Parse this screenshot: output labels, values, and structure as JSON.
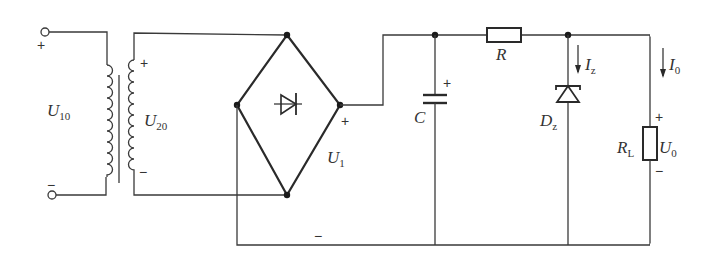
{
  "diagram": {
    "type": "circuit-schematic",
    "colors": {
      "line": "#3a3a3a",
      "background": "#ffffff"
    },
    "labels": {
      "primary_voltage": {
        "main": "U",
        "sub": "10"
      },
      "secondary_voltage": {
        "main": "U",
        "sub": "20"
      },
      "rectified_voltage": {
        "main": "U",
        "sub": "1"
      },
      "capacitor": {
        "main": "C"
      },
      "resistor": {
        "main": "R"
      },
      "zener": {
        "main": "D",
        "sub": "z"
      },
      "zener_current": {
        "main": "I",
        "sub": "z"
      },
      "load_current": {
        "main": "I",
        "sub": "0"
      },
      "load_resistor": {
        "main": "R",
        "sub": "L"
      },
      "output_voltage": {
        "main": "U",
        "sub": "0"
      }
    },
    "signs": {
      "primary_plus": "+",
      "primary_minus": "−",
      "secondary_plus": "+",
      "secondary_minus": "−",
      "rectified_plus": "+",
      "rectified_minus": "−",
      "capacitor_plus": "+",
      "output_plus": "+",
      "output_minus": "−"
    },
    "components": [
      {
        "id": "T",
        "kind": "transformer"
      },
      {
        "id": "bridge",
        "kind": "bridge-rectifier"
      },
      {
        "id": "C",
        "kind": "electrolytic-capacitor"
      },
      {
        "id": "R",
        "kind": "resistor"
      },
      {
        "id": "Dz",
        "kind": "zener-diode"
      },
      {
        "id": "RL",
        "kind": "load-resistor"
      }
    ]
  }
}
